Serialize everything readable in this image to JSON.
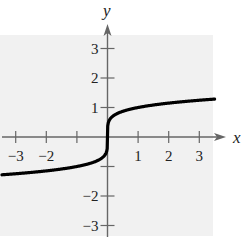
{
  "chart_data": {
    "type": "line",
    "title": "",
    "xlabel": "x",
    "ylabel": "y",
    "xlim": [
      -3.5,
      3.5
    ],
    "ylim": [
      -3.3,
      3.5
    ],
    "grid": false,
    "background_color": "#f1f1f1",
    "curve_color": "#000000",
    "axis_color": "#666666",
    "x_ticks": [
      -3,
      -2,
      -1,
      1,
      2,
      3
    ],
    "x_tick_labels": [
      "−3",
      "−2",
      "",
      "1",
      "2",
      "3"
    ],
    "y_ticks": [
      -3,
      -2,
      -1,
      1,
      2,
      3
    ],
    "y_tick_labels": [
      "−3",
      "−2",
      "",
      "1",
      "2",
      "3"
    ],
    "series": [
      {
        "name": "f(x)",
        "x": [
          -3.45,
          -3,
          -2.5,
          -2,
          -1.5,
          -1,
          -0.6,
          -0.3,
          -0.1,
          -0.02,
          0,
          0.02,
          0.1,
          0.3,
          0.6,
          1,
          1.5,
          2,
          2.5,
          3,
          3.5
        ],
        "y": [
          -1.28,
          -1.25,
          -1.2,
          -1.15,
          -1.08,
          -1.0,
          -0.9,
          -0.79,
          -0.63,
          -0.46,
          0,
          0.46,
          0.63,
          0.79,
          0.9,
          1.0,
          1.08,
          1.15,
          1.2,
          1.25,
          1.28
        ]
      }
    ]
  }
}
